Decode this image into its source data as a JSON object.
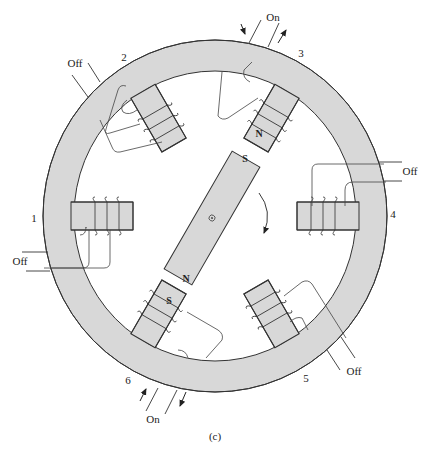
{
  "figure": {
    "caption": "(c)"
  },
  "colors": {
    "steel_fill": "#d8d8d8",
    "outline": "#333333",
    "background": "#ffffff"
  },
  "stator": {
    "poles": [
      {
        "number": "1",
        "state": "Off",
        "pole_label": ""
      },
      {
        "number": "2",
        "state": "Off",
        "pole_label": ""
      },
      {
        "number": "3",
        "state": "On",
        "pole_label": "N"
      },
      {
        "number": "4",
        "state": "Off",
        "pole_label": ""
      },
      {
        "number": "5",
        "state": "Off",
        "pole_label": ""
      },
      {
        "number": "6",
        "state": "On",
        "pole_label": "S"
      }
    ]
  },
  "rotor": {
    "top_label": "S",
    "bottom_label": "N",
    "center_icon": "shaft-center-icon",
    "rotation_direction": "clockwise"
  }
}
